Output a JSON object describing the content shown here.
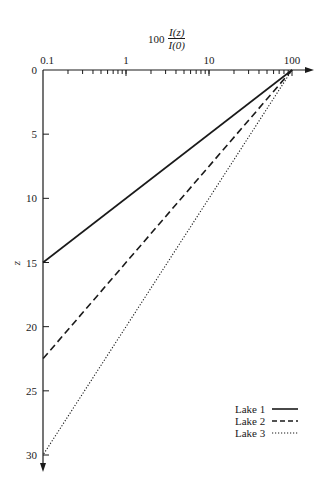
{
  "chart_data": {
    "type": "line",
    "title_parts": {
      "coefficient": "100",
      "numerator": "I(z)",
      "denominator": "I(0)"
    },
    "xlabel": "100 I(z)/I(0)",
    "ylabel": "z",
    "x_scale": "log",
    "x_axis_position": "top",
    "y_inverted": true,
    "xlim": [
      0.1,
      100
    ],
    "ylim": [
      0,
      30
    ],
    "x_tick_labels": [
      "0.1",
      "1",
      "10",
      "100"
    ],
    "y_tick_labels": [
      "0",
      "5",
      "10",
      "15",
      "20",
      "25",
      "30"
    ],
    "grid": false,
    "legend_position": "lower right",
    "series": [
      {
        "name": "Lake 1",
        "style": "solid",
        "x": [
          100,
          0.1
        ],
        "z": [
          0,
          15
        ]
      },
      {
        "name": "Lake 2",
        "style": "dashed",
        "x": [
          100,
          0.1
        ],
        "z": [
          0,
          22.5
        ]
      },
      {
        "name": "Lake 3",
        "style": "dotted",
        "x": [
          100,
          0.1
        ],
        "z": [
          0,
          30
        ]
      }
    ]
  },
  "axis": {
    "x_labels": [
      "0.1",
      "1",
      "10",
      "100"
    ],
    "y_labels": [
      "0",
      "5",
      "10",
      "15",
      "20",
      "25",
      "30"
    ],
    "y_title": "z"
  },
  "legend": {
    "items": [
      {
        "label": "Lake 1"
      },
      {
        "label": "Lake 2"
      },
      {
        "label": "Lake 3"
      }
    ]
  },
  "colors": {
    "ink": "#1a1a1a",
    "background": "#ffffff"
  }
}
